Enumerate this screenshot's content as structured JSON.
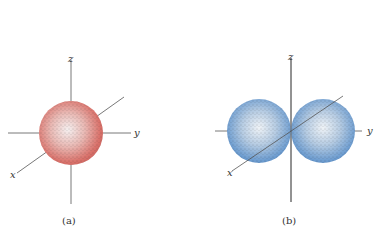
{
  "figure": {
    "panels": [
      {
        "id": "a",
        "caption": "(a)",
        "shape": "sphere",
        "color": "#d9716a",
        "axes": {
          "z": "z",
          "y": "y",
          "x": "x"
        }
      },
      {
        "id": "b",
        "caption": "(b)",
        "shape": "dumbbell",
        "color": "#5b8fc7",
        "axes": {
          "z": "z",
          "y": "y",
          "x": "x"
        }
      }
    ]
  }
}
